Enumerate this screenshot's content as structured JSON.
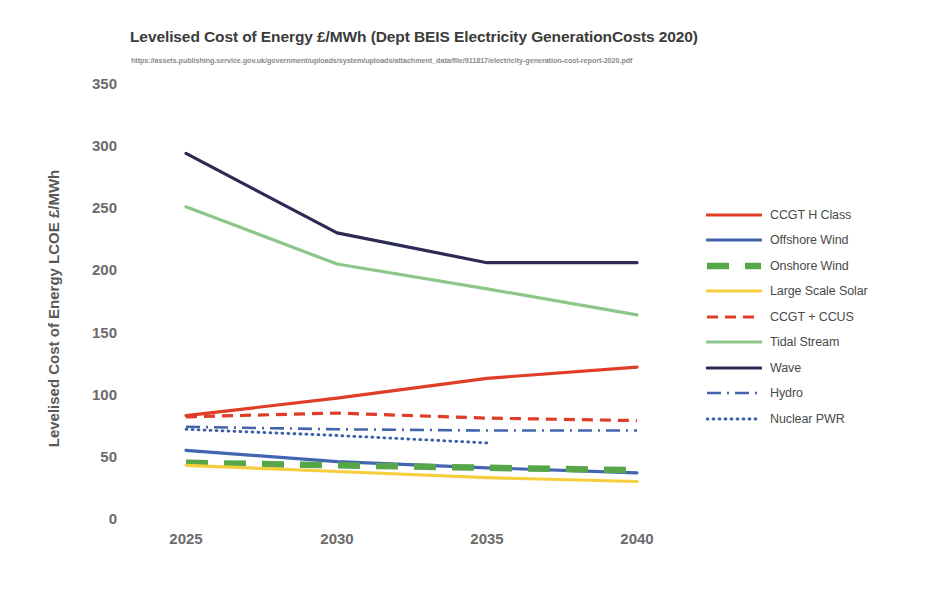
{
  "chart_data": {
    "type": "line",
    "title": "Levelised Cost of Energy £/MWh (Dept BEIS Electricity GenerationCosts 2020)",
    "subtitle": "https://assets.publishing.service.gov.uk/government/uploads/system/uploads/attachment_data/file/911817/electricity-generation-cost-report-2020.pdf",
    "xlabel": "",
    "ylabel": "Levelised Cost of Energy LCOE £/MWh",
    "x": [
      2025,
      2030,
      2035,
      2040
    ],
    "xtick_labels": [
      "2025",
      "2030",
      "2035",
      "2040"
    ],
    "ytick_labels": [
      "0",
      "50",
      "100",
      "150",
      "200",
      "250",
      "300",
      "350"
    ],
    "ylim": [
      0,
      350
    ],
    "ytick_step": 50,
    "grid": false,
    "legend_position": "right",
    "series": [
      {
        "name": "CCGT H Class",
        "color": "#E03C26",
        "style": "solid",
        "values": [
          84,
          98,
          114,
          123
        ]
      },
      {
        "name": "Offshore Wind",
        "color": "#4365B0",
        "style": "solid",
        "values": [
          56,
          47,
          42,
          38
        ]
      },
      {
        "name": "Onshore Wind",
        "color": "#57A64A",
        "style": "dashed-thick",
        "values": [
          46,
          44,
          42,
          40
        ]
      },
      {
        "name": "Large Scale Solar",
        "color": "#F5CE3E",
        "style": "solid",
        "values": [
          44,
          39,
          34,
          31
        ]
      },
      {
        "name": "CCGT + CCUS",
        "color": "#E03C26",
        "style": "dashed",
        "values": [
          83,
          86,
          82,
          80
        ]
      },
      {
        "name": "Tidal Stream",
        "color": "#8CC68A",
        "style": "solid",
        "values": [
          252,
          206,
          186,
          165
        ]
      },
      {
        "name": "Wave",
        "color": "#2B2B55",
        "style": "solid",
        "values": [
          295,
          231,
          207,
          207
        ]
      },
      {
        "name": "Hydro",
        "color": "#4365B0",
        "style": "dashdot",
        "values": [
          75,
          73,
          72,
          72
        ]
      },
      {
        "name": "Nuclear PWR",
        "color": "#3C5FA8",
        "style": "dotted",
        "values": [
          73,
          68,
          62,
          null
        ]
      }
    ]
  },
  "axis": {
    "y_ticks": [
      {
        "label": "350"
      },
      {
        "label": "300"
      },
      {
        "label": "250"
      },
      {
        "label": "200"
      },
      {
        "label": "150"
      },
      {
        "label": "100"
      },
      {
        "label": "50"
      },
      {
        "label": "0"
      }
    ],
    "x_ticks": [
      {
        "label": "2025"
      },
      {
        "label": "2030"
      },
      {
        "label": "2035"
      },
      {
        "label": "2040"
      }
    ]
  },
  "legend": {
    "items": [
      {
        "label": "CCGT H Class"
      },
      {
        "label": "Offshore Wind"
      },
      {
        "label": "Onshore Wind"
      },
      {
        "label": "Large Scale Solar"
      },
      {
        "label": "CCGT + CCUS"
      },
      {
        "label": "Tidal Stream"
      },
      {
        "label": "Wave"
      },
      {
        "label": "Hydro"
      },
      {
        "label": "Nuclear PWR"
      }
    ]
  }
}
